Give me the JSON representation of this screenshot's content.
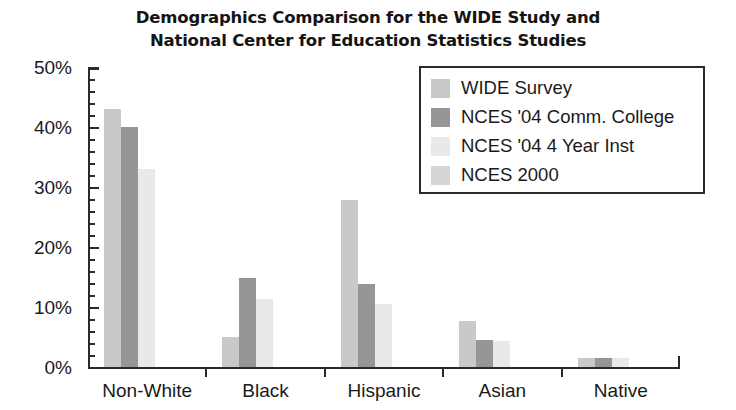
{
  "chart_data": {
    "type": "bar",
    "title": "Demographics Comparison for the WIDE Study and National Center for Education Statistics Studies",
    "title_lines": [
      "Demographics Comparison for the WIDE Study and",
      "National Center for Education Statistics Studies"
    ],
    "xlabel": "",
    "ylabel": "",
    "ylim": [
      0,
      50
    ],
    "ytick_step": 10,
    "yminor_step": 2,
    "ytick_labels": [
      "0%",
      "10%",
      "20%",
      "30%",
      "40%",
      "50%"
    ],
    "ytick_values": [
      0,
      10,
      20,
      30,
      40,
      50
    ],
    "grid": false,
    "legend_position": "upper-right",
    "categories": [
      "Non-White",
      "Black",
      "Hispanic",
      "Asian",
      "Native"
    ],
    "series": [
      {
        "name": "WIDE Survey",
        "color": "#c9c9c9",
        "values": [
          43.0,
          5.0,
          27.8,
          7.7,
          1.5
        ]
      },
      {
        "name": "NCES '04 Comm. College",
        "color": "#969696",
        "values": [
          40.0,
          14.8,
          13.8,
          4.5,
          1.5
        ]
      },
      {
        "name": "NCES '04 4 Year Inst",
        "color": "#e9e9e9",
        "values": [
          33.0,
          11.3,
          10.5,
          4.3,
          1.5
        ]
      },
      {
        "name": "NCES 2000",
        "color": "#d6d6d6",
        "values": [
          0,
          0,
          0,
          0,
          0
        ]
      }
    ]
  },
  "legend": {
    "items": [
      {
        "label": "WIDE Survey",
        "color": "#c9c9c9"
      },
      {
        "label": "NCES '04 Comm. College",
        "color": "#969696"
      },
      {
        "label": "NCES '04 4 Year Inst",
        "color": "#e9e9e9"
      },
      {
        "label": "NCES 2000",
        "color": "#d6d6d6"
      }
    ]
  },
  "colors": {
    "axis": "#2a2a2a",
    "text": "#1a1a1a",
    "background": "#ffffff"
  }
}
